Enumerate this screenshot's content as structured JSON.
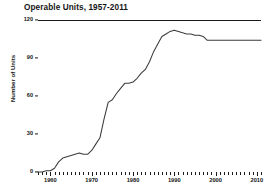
{
  "chart_data": {
    "type": "line",
    "title": "Operable Units,  1957-2011",
    "xlabel": "",
    "ylabel": "Number of Units",
    "xlim": [
      1957,
      2011
    ],
    "ylim": [
      0,
      120
    ],
    "yticks": [
      0,
      30,
      60,
      90,
      120
    ],
    "xticks_major": [
      1960,
      1970,
      1980,
      1990,
      2000,
      2010
    ],
    "xtick_labels": [
      "1960",
      "1970",
      "1980",
      "1990",
      "2000",
      "2010"
    ],
    "xtick_interval_minor": 1,
    "grid": false,
    "legend": null,
    "series_color": "#3a3a3a",
    "x": [
      1957,
      1958,
      1959,
      1960,
      1961,
      1962,
      1963,
      1964,
      1965,
      1966,
      1967,
      1968,
      1969,
      1970,
      1971,
      1972,
      1973,
      1974,
      1975,
      1976,
      1977,
      1978,
      1979,
      1980,
      1981,
      1982,
      1983,
      1984,
      1985,
      1986,
      1987,
      1988,
      1989,
      1990,
      1991,
      1992,
      1993,
      1994,
      1995,
      1996,
      1997,
      1998,
      1999,
      2000,
      2001,
      2002,
      2003,
      2004,
      2005,
      2006,
      2007,
      2008,
      2009,
      2010,
      2011
    ],
    "values": [
      0,
      0,
      1,
      1,
      3,
      8,
      11,
      12,
      13,
      14,
      15,
      14,
      14,
      17,
      22,
      27,
      42,
      55,
      57,
      62,
      66,
      70,
      70,
      71,
      74,
      78,
      81,
      87,
      95,
      101,
      107,
      109,
      111,
      112,
      111,
      110,
      109,
      109,
      108,
      108,
      107,
      104,
      104,
      104,
      104,
      104,
      104,
      104,
      104,
      104,
      104,
      104,
      104,
      104,
      104
    ]
  }
}
